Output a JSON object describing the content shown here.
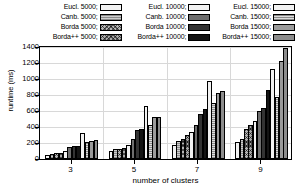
{
  "chart_data": {
    "type": "bar",
    "title": "",
    "xlabel": "number of clusters",
    "ylabel": "runtime (ms)",
    "categories": [
      "3",
      "5",
      "7",
      "9"
    ],
    "ylim": [
      0,
      1400
    ],
    "yticks": [
      0,
      200,
      400,
      600,
      800,
      1000,
      1200,
      1400
    ],
    "ytick_labels": [
      "0",
      "200",
      "400",
      "600",
      "800",
      "1000",
      "1200",
      "1400"
    ],
    "grid": true,
    "legend_position": "above-plot",
    "legend_columns": 3,
    "series": [
      {
        "name": "Eucl. 5000",
        "fill": "#f2f2f2",
        "pattern": "solid",
        "values": [
          55,
          100,
          180,
          210
        ]
      },
      {
        "name": "Canb. 5000",
        "fill": "#cccccc",
        "pattern": "dots",
        "values": [
          65,
          120,
          230,
          250
        ]
      },
      {
        "name": "Borda 5000",
        "fill": "#b5b5b5",
        "pattern": "crosshatch",
        "values": [
          70,
          130,
          250,
          380
        ]
      },
      {
        "name": "Borda++ 5000",
        "fill": "#a8a8a8",
        "pattern": "crosshatch",
        "values": [
          75,
          140,
          300,
          430
        ]
      },
      {
        "name": "Eucl. 10000",
        "fill": "#f2f2f2",
        "pattern": "solid",
        "values": [
          100,
          180,
          340,
          480
        ]
      },
      {
        "name": "Canb. 10000",
        "fill": "#6e6e6e",
        "pattern": "solid",
        "values": [
          150,
          250,
          430,
          600
        ]
      },
      {
        "name": "Borda 10000",
        "fill": "#333333",
        "pattern": "solid",
        "values": [
          160,
          360,
          560,
          640
        ]
      },
      {
        "name": "Borda++ 10000",
        "fill": "#141414",
        "pattern": "solid",
        "values": [
          165,
          380,
          620,
          860
        ]
      },
      {
        "name": "Eucl. 15000",
        "fill": "#f2f2f2",
        "pattern": "solid",
        "values": [
          330,
          660,
          980,
          1130
        ]
      },
      {
        "name": "Canb. 15000",
        "fill": "#dcdcdc",
        "pattern": "dots",
        "values": [
          210,
          420,
          700,
          770
        ]
      },
      {
        "name": "Borda 15000",
        "fill": "#9a9a9a",
        "pattern": "solid",
        "values": [
          230,
          520,
          830,
          1220
        ]
      },
      {
        "name": "Borda++ 15000",
        "fill": "#8c8c8c",
        "pattern": "solid",
        "values": [
          235,
          530,
          845,
          1390
        ]
      }
    ]
  },
  "legend": {
    "columns": [
      {
        "entries": [
          {
            "label": "Eucl. 5000;",
            "series": 0
          },
          {
            "label": "Canb. 5000;",
            "series": 1
          },
          {
            "label": "Borda 5000;",
            "series": 2
          },
          {
            "label": "Borda++ 5000;",
            "series": 3
          }
        ]
      },
      {
        "entries": [
          {
            "label": "Eucl. 10000;",
            "series": 4
          },
          {
            "label": "Canb. 10000;",
            "series": 5
          },
          {
            "label": "Borda 10000;",
            "series": 6
          },
          {
            "label": "Borda++ 10000;",
            "series": 7
          }
        ]
      },
      {
        "entries": [
          {
            "label": "Eucl. 15000;",
            "series": 8
          },
          {
            "label": "Canb. 15000;",
            "series": 9
          },
          {
            "label": "Borda 15000;",
            "series": 10
          },
          {
            "label": "Borda++ 15000;",
            "series": 11
          }
        ]
      }
    ]
  },
  "axes": {
    "y_title": "runtime (ms)",
    "x_title": "number of clusters"
  }
}
